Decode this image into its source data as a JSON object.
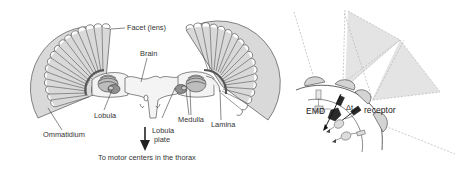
{
  "figure": {
    "left_panel": {
      "title": "Fly compound eye and optic lobes",
      "labels": {
        "facet": "Facet (lens)",
        "brain": "Brain",
        "lobula": "Lobula",
        "medulla": "Medulla",
        "lamina": "Lamina",
        "ommatidium": "Ommatidium",
        "lobula_plate_line1": "Lobula",
        "lobula_plate_line2": "plate",
        "motor": "To motor centers in the thorax"
      }
    },
    "right_panel": {
      "title": "Elementary motion detector schematic",
      "labels": {
        "emd": "EMD",
        "delta_t": "Δt",
        "receptor": "receptor"
      }
    },
    "colors": {
      "fan_fill": "#d9d9d9",
      "stroke": "#3a3a3a",
      "shaded_field": "#e4e4e4",
      "dashed": "#b5b5b5",
      "dark_component": "#2a2a2a",
      "light_component": "#dcdcdc"
    }
  }
}
